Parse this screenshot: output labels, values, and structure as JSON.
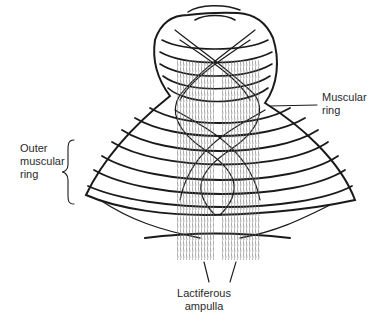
{
  "figure": {
    "labels": {
      "outer_muscular_ring": "Outer\nmuscular\nring",
      "muscular_ring": "Muscular\nring",
      "lactiferous_ampulla": "Lactiferous\nampulla"
    },
    "colors": {
      "ink": "#1a1a1a",
      "hatch": "#6a6a6a",
      "text": "#2a2a2a",
      "background": "#ffffff"
    }
  }
}
